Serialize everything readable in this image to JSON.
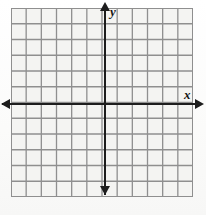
{
  "figure": {
    "kind": "cartesian-coordinate-grid",
    "background_color": "#fdfdfd",
    "grid_fill_color": "#f4f4f2",
    "grid_line_color": "#8f8f8f",
    "axis_color": "#1d1d1d"
  },
  "chart_data": {
    "type": "scatter",
    "title": "",
    "xlabel": "x",
    "ylabel": "y",
    "x": [],
    "y": [],
    "series": [],
    "grid": true,
    "legend": false,
    "xlim": [
      -6,
      6
    ],
    "ylim": [
      -6,
      6
    ],
    "x_ticks": [
      -6,
      -5,
      -4,
      -3,
      -2,
      -1,
      0,
      1,
      2,
      3,
      4,
      5,
      6
    ],
    "y_ticks": [
      -6,
      -5,
      -4,
      -3,
      -2,
      -1,
      0,
      1,
      2,
      3,
      4,
      5,
      6
    ],
    "x_tick_labels": [],
    "y_tick_labels": [],
    "columns": 12,
    "rows": 12,
    "cell_size_px": 15.2,
    "origin_column": 6,
    "origin_row": 6,
    "annotations": []
  },
  "labels": {
    "x_axis": "x",
    "y_axis": "y"
  },
  "icons": {
    "arrow_left": "arrow-left-icon",
    "arrow_right": "arrow-right-icon",
    "arrow_up": "arrow-up-icon",
    "arrow_down": "arrow-down-icon"
  }
}
